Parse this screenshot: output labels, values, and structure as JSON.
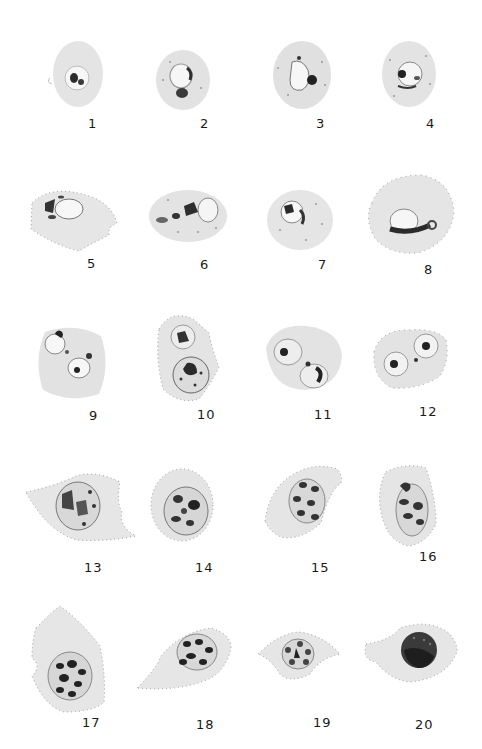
{
  "plate": {
    "description": "Plate of 20 numbered drawings of parasitized red blood cells showing developmental stages",
    "background_color": "#ffffff",
    "cell_color": "#e6e6e6",
    "stipple_color": "#9a9a9a",
    "parasite_color": "#2e2e2e"
  },
  "figures": [
    {
      "number": "1"
    },
    {
      "number": "2"
    },
    {
      "number": "3"
    },
    {
      "number": "4"
    },
    {
      "number": "5"
    },
    {
      "number": "6"
    },
    {
      "number": "7"
    },
    {
      "number": "8"
    },
    {
      "number": "9"
    },
    {
      "number": "10"
    },
    {
      "number": "11"
    },
    {
      "number": "12"
    },
    {
      "number": "13"
    },
    {
      "number": "14"
    },
    {
      "number": "15"
    },
    {
      "number": "16"
    },
    {
      "number": "17"
    },
    {
      "number": "18"
    },
    {
      "number": "19"
    },
    {
      "number": "20"
    }
  ]
}
